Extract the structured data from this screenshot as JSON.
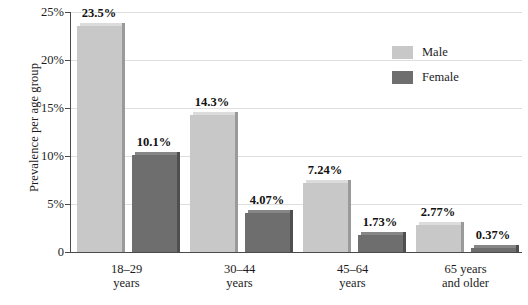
{
  "chart_data": {
    "type": "bar",
    "title": "",
    "xlabel": "",
    "ylabel": "Prevalence per age group",
    "ylim": [
      0,
      25
    ],
    "grid": true,
    "legend_position": "top-right",
    "categories": [
      "18–29\nyears",
      "30–44\nyears",
      "45–64\nyears",
      "65 years\nand older"
    ],
    "category_lines": [
      [
        "18–29",
        "years"
      ],
      [
        "30–44",
        "years"
      ],
      [
        "45–64",
        "years"
      ],
      [
        "65 years",
        "and older"
      ]
    ],
    "series": [
      {
        "name": "Male",
        "color": "#c8c8c8",
        "values": [
          23.5,
          14.3,
          7.24,
          2.77
        ],
        "labels": [
          "23.5%",
          "14.3%",
          "7.24%",
          "2.77%"
        ]
      },
      {
        "name": "Female",
        "color": "#6e6e6e",
        "values": [
          10.1,
          4.07,
          1.73,
          0.37
        ],
        "labels": [
          "10.1%",
          "4.07%",
          "1.73%",
          "0.37%"
        ]
      }
    ],
    "y_ticks": [
      {
        "value": 25,
        "label": "25%"
      },
      {
        "value": 20,
        "label": "20%"
      },
      {
        "value": 15,
        "label": "15%"
      },
      {
        "value": 10,
        "label": "10%"
      },
      {
        "value": 5,
        "label": "5%"
      },
      {
        "value": 0,
        "label": "0"
      }
    ]
  },
  "axis": {
    "y_title": "Prevalence per age group"
  },
  "legend": {
    "items": [
      {
        "label": "Male",
        "key": "male"
      },
      {
        "label": "Female",
        "key": "female"
      }
    ]
  },
  "colors": {
    "male": "#c8c8c8",
    "female": "#6e6e6e",
    "axis": "#4a4a4a",
    "grid": "#dedede",
    "text": "#1c1c1c"
  }
}
